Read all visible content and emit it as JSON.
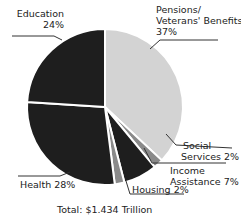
{
  "chart_data": {
    "type": "pie",
    "title": "",
    "categories": [
      "Pensions/ Veterans' Benefits",
      "Social Services",
      "Income Assistance",
      "Housing",
      "Health",
      "Education"
    ],
    "values": [
      37,
      2,
      7,
      2,
      28,
      24
    ],
    "unit": "%",
    "colors": [
      "#d3d3d3",
      "#8a8a8a",
      "#1e1e1e",
      "#8a8a8a",
      "#1e1e1e",
      "#1e1e1e"
    ],
    "total_label": "Total: $1.434 Trillion"
  },
  "labels": {
    "education_name": "Education",
    "education_pct": "24%",
    "pensions_line1": "Pensions/",
    "pensions_line2": "Veterans' Benefits",
    "pensions_pct": "37%",
    "social_line1": "Social",
    "social_line2": "Services 2%",
    "income_line1": "Income",
    "income_line2": "Assistance 7%",
    "housing": "Housing 2%",
    "health": "Health 28%",
    "total": "Total: $1.434 Trillion"
  }
}
